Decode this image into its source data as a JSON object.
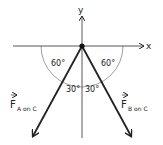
{
  "diagram": {
    "axes": {
      "x_label": "x",
      "y_label": "y"
    },
    "angles": {
      "left_upper": "60°",
      "right_upper": "60°",
      "left_lower": "30°",
      "right_lower": "30°"
    },
    "vectors": [
      {
        "label_main": "F",
        "label_sub": "A on C",
        "direction": "down-left"
      },
      {
        "label_main": "F",
        "label_sub": "B on C",
        "direction": "down-right"
      }
    ],
    "colors": {
      "ink": "#222222",
      "arc": "#888888"
    }
  }
}
